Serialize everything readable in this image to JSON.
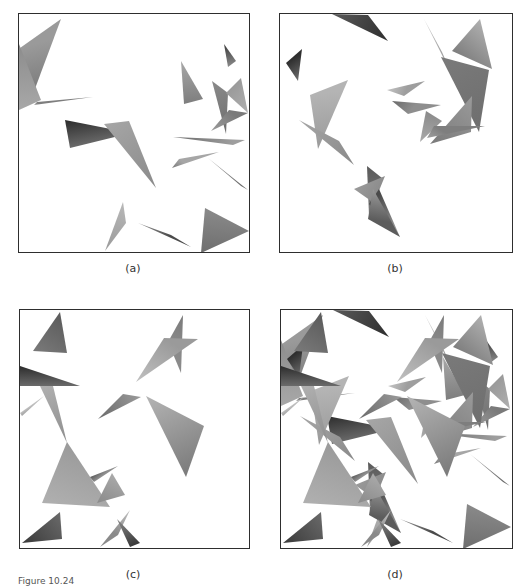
{
  "figure": {
    "caption": "Figure 10.24",
    "panels": [
      {
        "id": "a",
        "label": "(a)",
        "box": {
          "x": 18,
          "y": 13,
          "w": 232,
          "h": 240
        },
        "label_pos": {
          "x": 113,
          "y": 263
        },
        "triangles": [
          {
            "p": [
              [
                1,
                34
              ],
              [
                42,
                5
              ],
              [
                14,
                80
              ]
            ],
            "c": [
              "#9a9a9a",
              "#7a7a7a"
            ]
          },
          {
            "p": [
              [
                0,
                30
              ],
              [
                22,
                86
              ],
              [
                0,
                96
              ]
            ],
            "c": [
              "#8c8c8c",
              "#a8a8a8"
            ]
          },
          {
            "p": [
              [
                15,
                91
              ],
              [
                74,
                83
              ],
              [
                18,
                88
              ]
            ],
            "c": [
              "#a0a0a0",
              "#7e7e7e"
            ]
          },
          {
            "p": [
              [
                46,
                106
              ],
              [
                112,
                119
              ],
              [
                51,
                134
              ]
            ],
            "c": [
              "#2c2c2c",
              "#6a6a6a"
            ]
          },
          {
            "p": [
              [
                85,
                110
              ],
              [
                110,
                107
              ],
              [
                137,
                174
              ]
            ],
            "c": [
              "#a6a6a6",
              "#8a8a8a"
            ]
          },
          {
            "p": [
              [
                205,
                30
              ],
              [
                217,
                47
              ],
              [
                209,
                53
              ]
            ],
            "c": [
              "#3a3a3a",
              "#8a8a8a"
            ]
          },
          {
            "p": [
              [
                162,
                47
              ],
              [
                184,
                85
              ],
              [
                165,
                90
              ]
            ],
            "c": [
              "#a8a8a8",
              "#7e7e7e"
            ]
          },
          {
            "p": [
              [
                193,
                67
              ],
              [
                209,
                79
              ],
              [
                207,
                120
              ]
            ],
            "c": [
              "#8a8a8a",
              "#6e6e6e"
            ]
          },
          {
            "p": [
              [
                207,
                79
              ],
              [
                222,
                64
              ],
              [
                229,
                99
              ]
            ],
            "c": [
              "#9a9a9a",
              "#b0b0b0"
            ]
          },
          {
            "p": [
              [
                210,
                96
              ],
              [
                229,
                99
              ],
              [
                192,
                117
              ]
            ],
            "c": [
              "#7a7a7a",
              "#9c9c9c"
            ]
          },
          {
            "p": [
              [
                154,
                123
              ],
              [
                226,
                126
              ],
              [
                214,
                131
              ]
            ],
            "c": [
              "#6a6a6a",
              "#9e9e9e"
            ]
          },
          {
            "p": [
              [
                153,
                154
              ],
              [
                200,
                138
              ],
              [
                160,
                145
              ]
            ],
            "c": [
              "#7a7a7a",
              "#a6a6a6"
            ]
          },
          {
            "p": [
              [
                189,
                144
              ],
              [
                229,
                176
              ],
              [
                222,
                172
              ]
            ],
            "c": [
              "#9a9a9a",
              "#6a6a6a"
            ]
          },
          {
            "p": [
              [
                104,
                188
              ],
              [
                107,
                209
              ],
              [
                86,
                237
              ]
            ],
            "c": [
              "#b8b8b8",
              "#9a9a9a"
            ]
          },
          {
            "p": [
              [
                119,
                209
              ],
              [
                172,
                233
              ],
              [
                152,
                221
              ]
            ],
            "c": [
              "#9a9a9a",
              "#4a4a4a"
            ]
          },
          {
            "p": [
              [
                186,
                194
              ],
              [
                230,
                217
              ],
              [
                182,
                239
              ]
            ],
            "c": [
              "#8a8a8a",
              "#6e6e6e"
            ]
          }
        ]
      },
      {
        "id": "b",
        "label": "(b)",
        "box": {
          "x": 279,
          "y": 13,
          "w": 234,
          "h": 240
        },
        "label_pos": {
          "x": 375,
          "y": 263
        },
        "triangles": [
          {
            "p": [
              [
                52,
                0
              ],
              [
                88,
                1
              ],
              [
                108,
                27
              ]
            ],
            "c": [
              "#5a5a5a",
              "#2e2e2e"
            ]
          },
          {
            "p": [
              [
                6,
                49
              ],
              [
                22,
                35
              ],
              [
                18,
                67
              ]
            ],
            "c": [
              "#2e2e2e",
              "#6e6e6e"
            ]
          },
          {
            "p": [
              [
                30,
                81
              ],
              [
                68,
                66
              ],
              [
                38,
                135
              ]
            ],
            "c": [
              "#b4b4b4",
              "#9a9a9a"
            ]
          },
          {
            "p": [
              [
                19,
                106
              ],
              [
                59,
                127
              ],
              [
                74,
                151
              ]
            ],
            "c": [
              "#a6a6a6",
              "#8a8a8a"
            ]
          },
          {
            "p": [
              [
                144,
                5
              ],
              [
                162,
                38
              ],
              [
                172,
                61
              ]
            ],
            "c": [
              "#c4c4c4",
              "#8e8e8e"
            ]
          },
          {
            "p": [
              [
                200,
                5
              ],
              [
                212,
                55
              ],
              [
                172,
                37
              ]
            ],
            "c": [
              "#b0b0b0",
              "#7e7e7e"
            ]
          },
          {
            "p": [
              [
                161,
                43
              ],
              [
                209,
                56
              ],
              [
                199,
                118
              ]
            ],
            "c": [
              "#7a7a7a",
              "#6e6e6e"
            ]
          },
          {
            "p": [
              [
                107,
                76
              ],
              [
                145,
                67
              ],
              [
                124,
                82
              ]
            ],
            "c": [
              "#c4c4c4",
              "#9e9e9e"
            ]
          },
          {
            "p": [
              [
                112,
                87
              ],
              [
                161,
                91
              ],
              [
                128,
                100
              ]
            ],
            "c": [
              "#6a6a6a",
              "#8e8e8e"
            ]
          },
          {
            "p": [
              [
                146,
                97
              ],
              [
                162,
                107
              ],
              [
                140,
                128
              ]
            ],
            "c": [
              "#8a8a8a",
              "#aaaaaa"
            ]
          },
          {
            "p": [
              [
                192,
                82
              ],
              [
                191,
                118
              ],
              [
                150,
                130
              ]
            ],
            "c": [
              "#9a9a9a",
              "#7a7a7a"
            ]
          },
          {
            "p": [
              [
                154,
                112
              ],
              [
                205,
                112
              ],
              [
                147,
                124
              ]
            ],
            "c": [
              "#7e7e7e",
              "#a0a0a0"
            ]
          },
          {
            "p": [
              [
                87,
                152
              ],
              [
                102,
                164
              ],
              [
                89,
                202
              ]
            ],
            "c": [
              "#5a5a5a",
              "#7e7e7e"
            ]
          },
          {
            "p": [
              [
                74,
                175
              ],
              [
                105,
                162
              ],
              [
                94,
                189
              ]
            ],
            "c": [
              "#9a9a9a",
              "#8a8a8a"
            ]
          },
          {
            "p": [
              [
                89,
                190
              ],
              [
                99,
                175
              ],
              [
                120,
                223
              ]
            ],
            "c": [
              "#4a4a4a",
              "#a8a8a8"
            ]
          },
          {
            "p": [
              [
                88,
                205
              ],
              [
                120,
                223
              ],
              [
                93,
                175
              ]
            ],
            "c": [
              "#5c5c5c",
              "#9a9a9a"
            ]
          }
        ]
      },
      {
        "id": "c",
        "label": "(c)",
        "box": {
          "x": 19,
          "y": 309,
          "w": 231,
          "h": 240
        },
        "label_pos": {
          "x": 113,
          "y": 569
        },
        "triangles": [
          {
            "p": [
              [
                40,
                2
              ],
              [
                47,
                43
              ],
              [
                13,
                41
              ]
            ],
            "c": [
              "#5a5a5a",
              "#7a7a7a"
            ]
          },
          {
            "p": [
              [
                0,
                56
              ],
              [
                60,
                76
              ],
              [
                0,
                76
              ]
            ],
            "c": [
              "#2c2c2c",
              "#6a6a6a"
            ]
          },
          {
            "p": [
              [
                20,
                76
              ],
              [
                33,
                76
              ],
              [
                47,
                133
              ]
            ],
            "c": [
              "#b0b0b0",
              "#8e8e8e"
            ]
          },
          {
            "p": [
              [
                0,
                103
              ],
              [
                24,
                86
              ],
              [
                2,
                106
              ]
            ],
            "c": [
              "#c0c0c0",
              "#a0a0a0"
            ]
          },
          {
            "p": [
              [
                47,
                132
              ],
              [
                90,
                197
              ],
              [
                22,
                193
              ]
            ],
            "c": [
              "#9a9a9a",
              "#b0b0b0"
            ]
          },
          {
            "p": [
              [
                92,
                163
              ],
              [
                105,
                185
              ],
              [
                77,
                193
              ]
            ],
            "c": [
              "#aaaaaa",
              "#8a8a8a"
            ]
          },
          {
            "p": [
              [
                70,
                167
              ],
              [
                98,
                156
              ],
              [
                74,
                172
              ]
            ],
            "c": [
              "#5a5a5a",
              "#8e8e8e"
            ]
          },
          {
            "p": [
              [
                40,
                202
              ],
              [
                42,
                229
              ],
              [
                2,
                233
              ]
            ],
            "c": [
              "#6a6a6a",
              "#3a3a3a"
            ]
          },
          {
            "p": [
              [
                110,
                200
              ],
              [
                80,
                237
              ],
              [
                98,
                225
              ]
            ],
            "c": [
              "#c0c0c0",
              "#8a8a8a"
            ]
          },
          {
            "p": [
              [
                97,
                209
              ],
              [
                120,
                233
              ],
              [
                110,
                237
              ]
            ],
            "c": [
              "#8a8a8a",
              "#3a3a3a"
            ]
          },
          {
            "p": [
              [
                163,
                5
              ],
              [
                161,
                63
              ],
              [
                148,
                32
              ]
            ],
            "c": [
              "#7a7a7a",
              "#8a8a8a"
            ]
          },
          {
            "p": [
              [
                116,
                72
              ],
              [
                178,
                29
              ],
              [
                144,
                28
              ]
            ],
            "c": [
              "#c0c0c0",
              "#9a9a9a"
            ]
          },
          {
            "p": [
              [
                78,
                109
              ],
              [
                103,
                84
              ],
              [
                121,
                87
              ]
            ],
            "c": [
              "#6a6a6a",
              "#9a9a9a"
            ]
          },
          {
            "p": [
              [
                126,
                86
              ],
              [
                184,
                116
              ],
              [
                166,
                167
              ]
            ],
            "c": [
              "#b4b4b4",
              "#7a7a7a"
            ]
          }
        ]
      },
      {
        "id": "d",
        "label": "(d)",
        "box": {
          "x": 280,
          "y": 309,
          "w": 233,
          "h": 240
        },
        "label_pos": {
          "x": 375,
          "y": 569
        },
        "composite_of": [
          "a",
          "b",
          "c"
        ]
      }
    ]
  }
}
